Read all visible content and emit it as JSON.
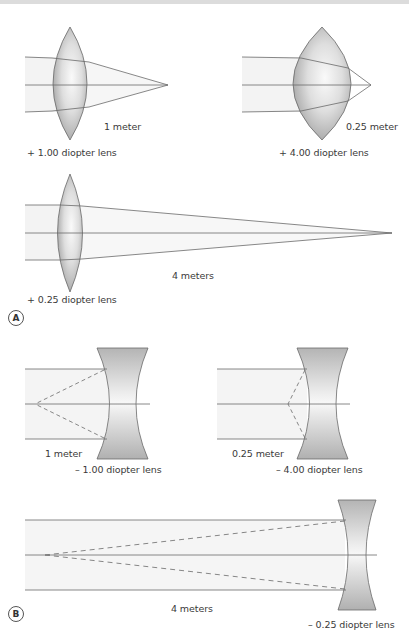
{
  "figure": {
    "panel_a": {
      "letter": "A",
      "lenses": [
        {
          "power_label": "+ 1.00 diopter lens",
          "distance_label": "1 meter",
          "type": "convex"
        },
        {
          "power_label": "+ 4.00 diopter lens",
          "distance_label": "0.25 meter",
          "type": "convex"
        },
        {
          "power_label": "+ 0.25 diopter lens",
          "distance_label": "4 meters",
          "type": "convex"
        }
      ]
    },
    "panel_b": {
      "letter": "B",
      "lenses": [
        {
          "power_label": "– 1.00 diopter lens",
          "distance_label": "1 meter",
          "type": "concave"
        },
        {
          "power_label": "– 4.00 diopter lens",
          "distance_label": "0.25 meter",
          "type": "concave"
        },
        {
          "power_label": "– 0.25 diopter lens",
          "distance_label": "4 meters",
          "type": "concave"
        }
      ]
    },
    "colors": {
      "ray": "#6a6a6a",
      "lens_fill_dark": "#a9a9a9",
      "lens_fill_light": "#f2f2f2",
      "beam_shade": "#f3f3f3",
      "text": "#3a3a3a"
    }
  }
}
